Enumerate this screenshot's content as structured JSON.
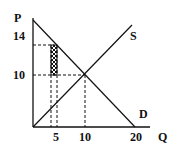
{
  "diagram": {
    "type": "supply-demand",
    "axes": {
      "y_label": "P",
      "x_label": "Q"
    },
    "y_ticks": [
      {
        "label": "14",
        "value": 14
      },
      {
        "label": "10",
        "value": 10
      }
    ],
    "x_ticks": [
      {
        "label": "5",
        "value": 5
      },
      {
        "label": "10",
        "value": 10
      },
      {
        "label": "20",
        "value": 20
      }
    ],
    "curves": [
      {
        "name": "S",
        "label": "S",
        "kind": "supply"
      },
      {
        "name": "D",
        "label": "D",
        "kind": "demand"
      }
    ],
    "equilibrium": {
      "Q": 10,
      "P": 10
    },
    "shaded_region": {
      "Q_from": 5,
      "P_from": 10,
      "P_to": 14,
      "pattern": "crosshatch"
    },
    "colors": {
      "line": "#111111",
      "background": "#ffffff"
    }
  }
}
